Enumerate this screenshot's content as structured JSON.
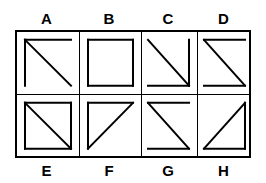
{
  "figure": {
    "type": "shape-grid",
    "rows": 2,
    "columns": 4,
    "stroke_color": "#000000",
    "background_color": "#ffffff",
    "border_color": "#000000"
  },
  "top_labels": [
    {
      "text": "A"
    },
    {
      "text": "B"
    },
    {
      "text": "C"
    },
    {
      "text": "D"
    }
  ],
  "bottom_labels": [
    {
      "text": "E"
    },
    {
      "text": "F"
    },
    {
      "text": "G"
    },
    {
      "text": "H"
    }
  ],
  "cells": [
    {
      "label": "A",
      "row": 0,
      "col": 0,
      "description": "top edge, left edge, diagonal from top-left to bottom-right",
      "edges": [
        "top",
        "left"
      ],
      "diagonal": "tl-br"
    },
    {
      "label": "B",
      "row": 0,
      "col": 1,
      "description": "complete square, no diagonal",
      "edges": [
        "top",
        "right",
        "bottom",
        "left"
      ],
      "diagonal": "none"
    },
    {
      "label": "C",
      "row": 0,
      "col": 2,
      "description": "right edge, bottom edge, diagonal from top-left to bottom-right",
      "edges": [
        "right",
        "bottom"
      ],
      "diagonal": "tl-br"
    },
    {
      "label": "D",
      "row": 0,
      "col": 3,
      "description": "top edge, bottom edge, diagonal from top-left to bottom-right",
      "edges": [
        "top",
        "bottom"
      ],
      "diagonal": "tl-br"
    },
    {
      "label": "E",
      "row": 1,
      "col": 0,
      "description": "complete square with diagonal from top-left to bottom-right",
      "edges": [
        "top",
        "right",
        "bottom",
        "left"
      ],
      "diagonal": "tl-br"
    },
    {
      "label": "F",
      "row": 1,
      "col": 1,
      "description": "top edge, left edge, diagonal from bottom-left to top-right",
      "edges": [
        "top",
        "left"
      ],
      "diagonal": "bl-tr"
    },
    {
      "label": "G",
      "row": 1,
      "col": 2,
      "description": "top edge, bottom edge, diagonal from top-left to bottom-right",
      "edges": [
        "top",
        "bottom"
      ],
      "diagonal": "tl-br"
    },
    {
      "label": "H",
      "row": 1,
      "col": 3,
      "description": "right edge, bottom edge, diagonal from bottom-left to top-right",
      "edges": [
        "right",
        "bottom"
      ],
      "diagonal": "bl-tr"
    }
  ]
}
